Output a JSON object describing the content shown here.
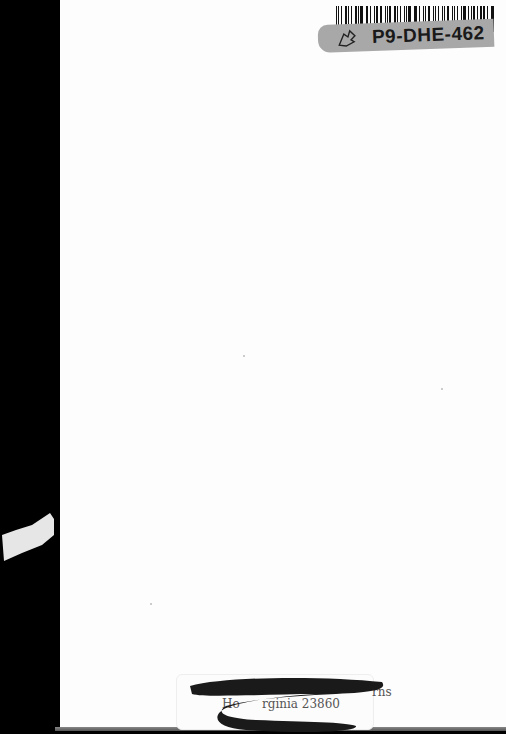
{
  "document": {
    "type": "scanned-book-page",
    "page_color": "#fdfdfd",
    "background_color": "#000000"
  },
  "library_label": {
    "barcode_id": "P9-DHE-462",
    "label_color": "#a8a8a8",
    "icon": "leaf-outline-icon"
  },
  "stamp": {
    "line1_visible_end": "rns",
    "line2_visible_start": "Ho",
    "line2_visible_end": "rginia 23860",
    "redacted": true,
    "redaction_color": "#1a1a1a"
  }
}
